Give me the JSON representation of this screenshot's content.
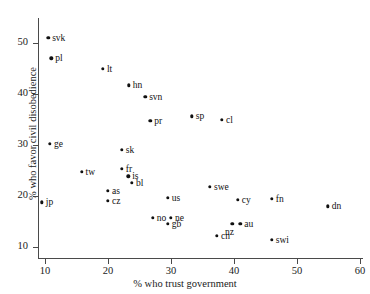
{
  "chart_data": {
    "type": "scatter",
    "title": "",
    "xlabel": "% who trust government",
    "ylabel": "% who favor civil disobedience",
    "xlim": [
      6,
      62
    ],
    "ylim": [
      8,
      53
    ],
    "xticks": [
      10,
      20,
      30,
      40,
      50,
      60
    ],
    "yticks": [
      10,
      20,
      30,
      40,
      50
    ],
    "grid": false,
    "legend": "none",
    "points": [
      {
        "label": "svk",
        "x": 10.5,
        "y": 51.0,
        "label_pos": "right"
      },
      {
        "label": "pl",
        "x": 11.0,
        "y": 47.0,
        "label_pos": "right"
      },
      {
        "label": "lt",
        "x": 19.2,
        "y": 45.0,
        "label_pos": "right"
      },
      {
        "label": "hn",
        "x": 23.3,
        "y": 41.7,
        "label_pos": "right"
      },
      {
        "label": "svn",
        "x": 25.9,
        "y": 39.4,
        "label_pos": "right"
      },
      {
        "label": "pr",
        "x": 26.7,
        "y": 34.8,
        "label_pos": "right"
      },
      {
        "label": "sp",
        "x": 33.3,
        "y": 35.6,
        "label_pos": "right"
      },
      {
        "label": "cl",
        "x": 38.1,
        "y": 35.0,
        "label_pos": "right"
      },
      {
        "label": "ge",
        "x": 10.8,
        "y": 30.2,
        "label_pos": "right"
      },
      {
        "label": "sk",
        "x": 22.2,
        "y": 29.0,
        "label_pos": "right"
      },
      {
        "label": "fr",
        "x": 22.2,
        "y": 25.3,
        "label_pos": "right"
      },
      {
        "label": "is",
        "x": 23.2,
        "y": 23.9,
        "label_pos": "right"
      },
      {
        "label": "bl",
        "x": 23.8,
        "y": 22.6,
        "label_pos": "right"
      },
      {
        "label": "tw",
        "x": 15.8,
        "y": 24.8,
        "label_pos": "right"
      },
      {
        "label": "as",
        "x": 20.0,
        "y": 21.0,
        "label_pos": "right"
      },
      {
        "label": "cz",
        "x": 20.0,
        "y": 19.0,
        "label_pos": "right"
      },
      {
        "label": "jp",
        "x": 9.5,
        "y": 18.8,
        "label_pos": "right"
      },
      {
        "label": "us",
        "x": 29.5,
        "y": 19.6,
        "label_pos": "right"
      },
      {
        "label": "swe",
        "x": 36.2,
        "y": 21.8,
        "label_pos": "right"
      },
      {
        "label": "cy",
        "x": 40.6,
        "y": 19.2,
        "label_pos": "right"
      },
      {
        "label": "fn",
        "x": 46.0,
        "y": 19.4,
        "label_pos": "right"
      },
      {
        "label": "dn",
        "x": 54.9,
        "y": 18.0,
        "label_pos": "right"
      },
      {
        "label": "no",
        "x": 27.1,
        "y": 15.7,
        "label_pos": "right"
      },
      {
        "label": "ne",
        "x": 30.0,
        "y": 15.7,
        "label_pos": "right"
      },
      {
        "label": "gb",
        "x": 29.5,
        "y": 14.5,
        "label_pos": "right"
      },
      {
        "label": "nz",
        "x": 39.7,
        "y": 14.5,
        "label_pos": "below"
      },
      {
        "label": "au",
        "x": 41.0,
        "y": 14.5,
        "label_pos": "right"
      },
      {
        "label": "cn",
        "x": 37.3,
        "y": 12.2,
        "label_pos": "right"
      },
      {
        "label": "swi",
        "x": 46.0,
        "y": 11.4,
        "label_pos": "right"
      }
    ]
  }
}
